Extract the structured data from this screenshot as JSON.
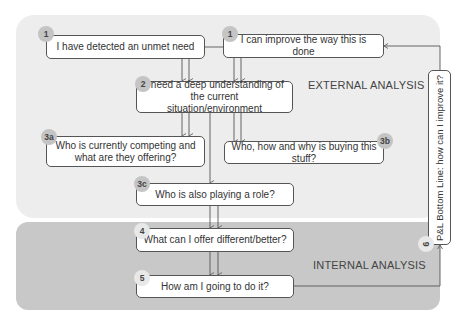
{
  "diagram": {
    "regions": {
      "external": {
        "label": "EXTERNAL ANALYSIS",
        "color": "#ededed"
      },
      "internal": {
        "label": "INTERNAL ANALYSIS",
        "color": "#c8c8c8"
      }
    },
    "steps": [
      {
        "id": "1a",
        "badge": "1",
        "text": "I have detected an unmet need"
      },
      {
        "id": "1b",
        "badge": "1",
        "text": "I can improve the way this is done"
      },
      {
        "id": "2",
        "badge": "2",
        "text": "I need a deep understanding of the current situation/environment"
      },
      {
        "id": "3a",
        "badge": "3a",
        "text": "Who is currently competing and what are they offering?"
      },
      {
        "id": "3b",
        "badge": "3b",
        "text": "Who, how and why is buying this stuff?"
      },
      {
        "id": "3c",
        "badge": "3c",
        "text": "Who is also playing a role?"
      },
      {
        "id": "4",
        "badge": "4",
        "text": "What can I offer different/better?"
      },
      {
        "id": "5",
        "badge": "5",
        "text": "How am I going to do it?"
      },
      {
        "id": "6",
        "badge": "6",
        "text": "P&L Bottom Line: how can I improve it?"
      }
    ],
    "line_color": "#555555"
  }
}
